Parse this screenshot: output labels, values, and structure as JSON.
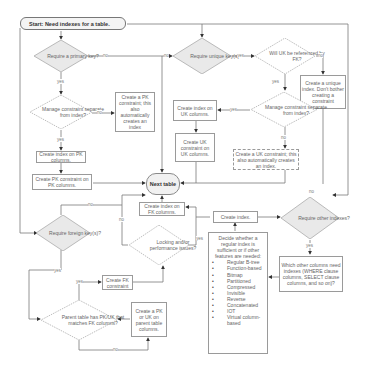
{
  "start": {
    "label": "Start: Need indexes for a table."
  },
  "terminal": {
    "label": "Next table"
  },
  "decisions": {
    "require_pk": "Require a primary key?",
    "manage_pk_separate": "Manage constraint separate from index?",
    "require_uk": "Require unique key(s)?",
    "uk_referenced_fk": "Will UK be referenced by FK?",
    "manage_uk_separate": "Manage constraint separate from index?",
    "require_fk": "Require foreign key(s)?",
    "locking_issues": "Locking and/or performance issues?",
    "parent_has_pk": "Parent table has PK/UK that matches FK columns?",
    "require_other": "Require other indexes?"
  },
  "actions": {
    "create_pk_constraint_auto": "Create a PK constraint; this also automatically creates an index",
    "create_index_pk_cols": "Create index on PK columns.",
    "create_pk_constraint_pk_cols": "Create PK constraint on PK columns.",
    "create_index_uk_cols": "Create index on UK columns.",
    "create_uk_constraint": "Create UK constraint on UK columns.",
    "create_unique_index": "Create a unique index. Don't bother creating a constraint",
    "create_uk_constraint_auto": "Create a UK constraint; this also automatically creates an index.",
    "create_index_fk_cols": "Create index on FK columns.",
    "create_fk_constraint": "Create FK constraint",
    "create_pk_uk_parent": "Create a PK or UK on parent table columns.",
    "create_index": "Create index.",
    "which_other_columns": "Which other columns need indexes (WHERE clause columns, SELECT clause columns, and so on)?"
  },
  "decide_box": {
    "heading": "Decide whether a regular index is sufficient or if other features are needed:",
    "items": [
      "Regular B-tree",
      "Function-based",
      "Bitmap",
      "Partitioned",
      "Compressed",
      "Invisible",
      "Reverse",
      "Concatenated",
      "IOT",
      "Virtual column-based"
    ]
  },
  "edge_labels": {
    "yes": "yes",
    "no": "no"
  },
  "colors": {
    "line": "#7a7a7a",
    "diamond_fill": "#e9e9e9",
    "diamond_stroke": "#a0a0a0",
    "box_border": "#9a9a9a"
  }
}
